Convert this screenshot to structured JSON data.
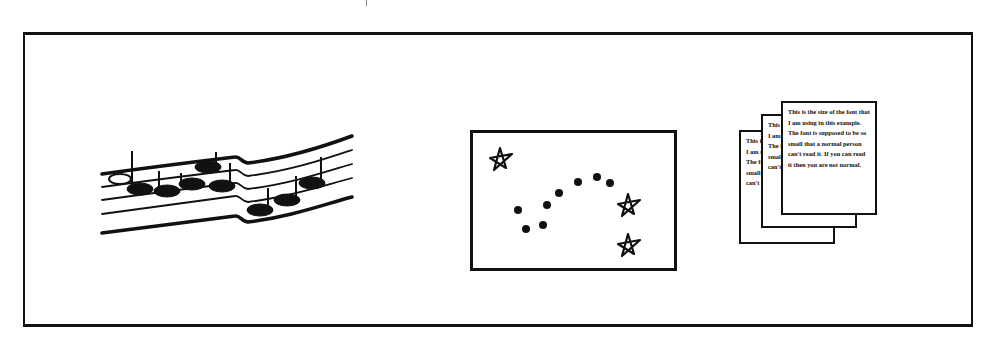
{
  "figure": {
    "panels": [
      {
        "id": "music",
        "label": "musical-staff-with-notes",
        "note_count": 8
      },
      {
        "id": "constellation",
        "label": "star-map-with-dots",
        "star_count": 3,
        "dot_count": 9
      },
      {
        "id": "documents",
        "label": "stacked-text-pages",
        "page_count": 3
      }
    ],
    "front_page_text": "This is the size of the font that I am using in this example. The font is supposed to be so small that a normal person can't read it. If you can read it then you are not normal.",
    "middle_page_text": "This is the size of the font that I am using in this example. The font is supposed to be so small that a normal person can't read it.",
    "back_page_text": "This is the size of the font that I am using in this example. The font is supposed to be so small that a normal person can't read it."
  },
  "colors": {
    "ink": "#111111",
    "background": "#ffffff"
  }
}
